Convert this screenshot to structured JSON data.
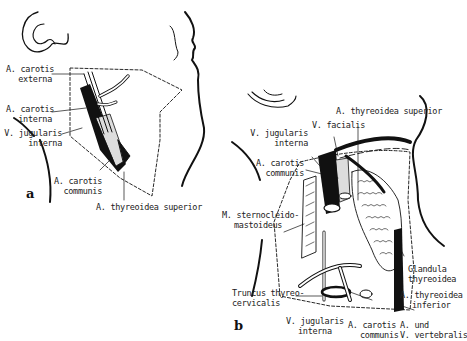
{
  "figure": {
    "panels": [
      {
        "id": "a",
        "letter": "a",
        "labels": {
          "carotis_externa": [
            "A. carotis",
            "externa"
          ],
          "carotis_interna": [
            "A. carotis",
            "interna"
          ],
          "jugularis_interna": [
            "V. jugularis",
            "interna"
          ],
          "carotis_communis": [
            "A. carotis",
            "communis"
          ],
          "thyreoidea_superior": "A. thyreoidea superior"
        }
      },
      {
        "id": "b",
        "letter": "b",
        "labels": {
          "thyreoidea_superior": "A. thyreoidea superior",
          "facialis": "V. facialis",
          "jugularis_interna_top": [
            "V. jugularis",
            "interna"
          ],
          "carotis_communis_top": [
            "A. carotis",
            "communis"
          ],
          "sternocleido": [
            "M. sternocleido-",
            "mastoideus"
          ],
          "glandula": [
            "Glandula",
            "thyreoidea"
          ],
          "thyreoidea_inferior": [
            "A. thyreoidea",
            "inferior"
          ],
          "truncus": [
            "Truncus thyreo-",
            "cervicalis"
          ],
          "jugularis_interna_bottom": [
            "V. jugularis",
            "interna"
          ],
          "carotis_communis_bottom": [
            "A. carotis",
            "communis"
          ],
          "vertebralis": [
            "A. und",
            "V. vertebralis"
          ]
        }
      }
    ]
  }
}
